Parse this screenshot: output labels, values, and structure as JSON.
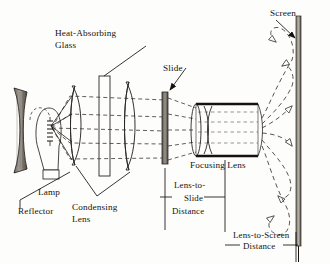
{
  "diagram": {
    "type": "optical-ray-diagram",
    "background_color": "#fdfdfb",
    "ink_color": "#15120e",
    "ray_color": "#3a3530"
  },
  "labels": {
    "heat_absorbing_glass": {
      "line1": "Heat-Absorbing",
      "line2": "Glass"
    },
    "slide": "Slide",
    "screen": "Screen",
    "lamp": "Lamp",
    "reflector": "Reflector",
    "condensing_lens": {
      "line1": "Condensing",
      "line2": "Lens"
    },
    "focusing_lens": "Focusing Lens",
    "lens_to_slide": {
      "line1": "Lens-to-",
      "line2": "Slide",
      "line3": "Distance"
    },
    "lens_to_screen": {
      "line1": "Lens-to-Screen",
      "line2": "Distance"
    }
  },
  "components": [
    {
      "name": "reflector",
      "kind": "concave-mirror",
      "x": 16,
      "y": 128
    },
    {
      "name": "lamp",
      "kind": "incandescent-bulb",
      "x": 46,
      "y": 128
    },
    {
      "name": "condenser-element-1",
      "kind": "plano-convex-lens",
      "x": 78,
      "y": 124
    },
    {
      "name": "heat-absorbing-glass",
      "kind": "flat-glass-plate",
      "x": 104,
      "y": 124
    },
    {
      "name": "condenser-element-2",
      "kind": "plano-convex-lens",
      "x": 128,
      "y": 124
    },
    {
      "name": "slide",
      "kind": "slide-transparency",
      "x": 165,
      "y": 127
    },
    {
      "name": "focusing-lens",
      "kind": "lens-barrel",
      "x": 225,
      "y": 128
    },
    {
      "name": "screen",
      "kind": "projection-screen",
      "x": 300,
      "y": 132
    }
  ],
  "dimensions": [
    {
      "name": "lens-to-slide-distance",
      "from": "slide",
      "to": "focusing-lens"
    },
    {
      "name": "lens-to-screen-distance",
      "from": "focusing-lens",
      "to": "screen"
    }
  ]
}
